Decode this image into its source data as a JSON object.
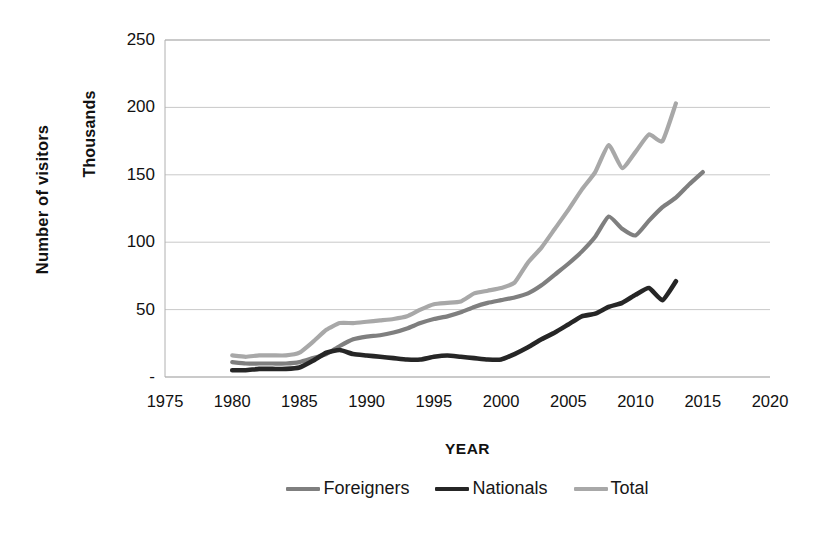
{
  "chart_data": {
    "type": "line",
    "title": "",
    "xlabel": "YEAR",
    "ylabel": "Number of visitors",
    "y_units_label": "Thousands",
    "xlim": [
      1975,
      2020
    ],
    "ylim": [
      0,
      250
    ],
    "xticks": [
      1975,
      1980,
      1985,
      1990,
      1995,
      2000,
      2005,
      2010,
      2015,
      2020
    ],
    "xticklabels": [
      "1975",
      "1980",
      "1985",
      "1990",
      "1995",
      "2000",
      "2005",
      "2010",
      "2015",
      "2020"
    ],
    "yticks": [
      0,
      50,
      100,
      150,
      200,
      250
    ],
    "yticklabels": [
      "-",
      "50",
      "100",
      "150",
      "200",
      "250"
    ],
    "grid": "horizontal",
    "legend_position": "bottom",
    "series": [
      {
        "name": "Foreigners",
        "color": "#7f7f7f",
        "x": [
          1980,
          1981,
          1982,
          1983,
          1984,
          1985,
          1986,
          1987,
          1988,
          1989,
          1990,
          1991,
          1992,
          1993,
          1994,
          1995,
          1996,
          1997,
          1998,
          1999,
          2000,
          2001,
          2002,
          2003,
          2004,
          2005,
          2006,
          2007,
          2008,
          2009,
          2010,
          2011,
          2012,
          2013,
          2014,
          2015
        ],
        "values": [
          11,
          10,
          10,
          10,
          10,
          11,
          14,
          17,
          23,
          28,
          30,
          31,
          33,
          36,
          40,
          43,
          45,
          48,
          52,
          55,
          57,
          59,
          62,
          68,
          76,
          84,
          93,
          104,
          119,
          110,
          105,
          116,
          126,
          133,
          143,
          152
        ]
      },
      {
        "name": "Nationals",
        "color": "#262626",
        "x": [
          1980,
          1981,
          1982,
          1983,
          1984,
          1985,
          1986,
          1987,
          1988,
          1989,
          1990,
          1991,
          1992,
          1993,
          1994,
          1995,
          1996,
          1997,
          1998,
          1999,
          2000,
          2001,
          2002,
          2003,
          2004,
          2005,
          2006,
          2007,
          2008,
          2009,
          2010,
          2011,
          2012,
          2013
        ],
        "values": [
          5,
          5,
          6,
          6,
          6,
          7,
          12,
          18,
          20,
          17,
          16,
          15,
          14,
          13,
          13,
          15,
          16,
          15,
          14,
          13,
          13,
          17,
          22,
          28,
          33,
          39,
          45,
          47,
          52,
          55,
          61,
          66,
          57,
          71
        ]
      },
      {
        "name": "Total",
        "color": "#a8a8a8",
        "x": [
          1980,
          1981,
          1982,
          1983,
          1984,
          1985,
          1986,
          1987,
          1988,
          1989,
          1990,
          1991,
          1992,
          1993,
          1994,
          1995,
          1996,
          1997,
          1998,
          1999,
          2000,
          2001,
          2002,
          2003,
          2004,
          2005,
          2006,
          2007,
          2008,
          2009,
          2010,
          2011,
          2012,
          2013
        ],
        "values": [
          16,
          15,
          16,
          16,
          16,
          18,
          26,
          35,
          40,
          40,
          41,
          42,
          43,
          45,
          50,
          54,
          55,
          56,
          62,
          64,
          66,
          70,
          85,
          96,
          110,
          124,
          139,
          152,
          172,
          155,
          167,
          180,
          175,
          203
        ]
      }
    ]
  },
  "legend": {
    "items": [
      {
        "label": "Foreigners",
        "color": "#7f7f7f"
      },
      {
        "label": "Nationals",
        "color": "#262626"
      },
      {
        "label": "Total",
        "color": "#a8a8a8"
      }
    ]
  },
  "axis_titles": {
    "y": "Number of visitors",
    "y_units": "Thousands",
    "x": "YEAR"
  },
  "style": {
    "grid_color": "#c9c9c9",
    "axis_color": "#b0b0b0",
    "text_color": "#111111",
    "background": "#ffffff"
  }
}
